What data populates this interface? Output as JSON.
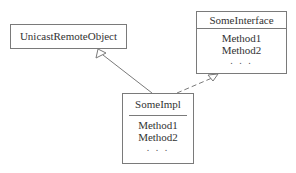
{
  "diagram": {
    "type": "uml-class-diagram",
    "classes": [
      {
        "id": "uro",
        "name": "UnicastRemoteObject",
        "methods": []
      },
      {
        "id": "iface",
        "name": "SomeInterface",
        "methods": [
          "Method1",
          "Method2"
        ],
        "ellipsis": ". . ."
      },
      {
        "id": "impl",
        "name": "SomeImpl",
        "methods": [
          "Method1",
          "Method2"
        ],
        "ellipsis": ". . ."
      }
    ],
    "relations": [
      {
        "from": "SomeImpl",
        "to": "UnicastRemoteObject",
        "kind": "generalization",
        "line": "solid",
        "head": "hollow-triangle"
      },
      {
        "from": "SomeImpl",
        "to": "SomeInterface",
        "kind": "realization",
        "line": "dashed",
        "head": "hollow-triangle"
      }
    ],
    "colors": {
      "line": "#7a7a7a",
      "text": "#333333",
      "background": "#ffffff"
    }
  }
}
